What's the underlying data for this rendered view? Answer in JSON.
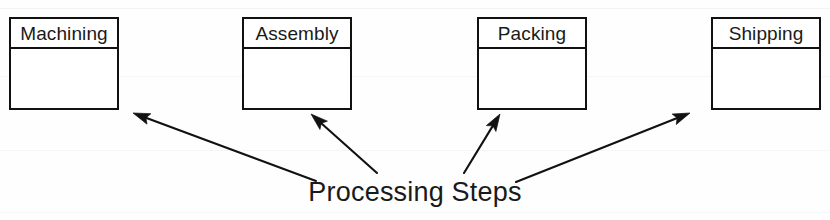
{
  "diagram": {
    "title": "Processing Steps",
    "caption": "Processing Steps",
    "background_color": "#fefefe",
    "line_color": "#111111",
    "text_color": "#1a1a1a",
    "boxes": [
      {
        "id": "machining",
        "label": "Machining",
        "x": 9,
        "y": 17,
        "width": 110,
        "height": 93
      },
      {
        "id": "assembly",
        "label": "Assembly",
        "x": 242,
        "y": 17,
        "width": 110,
        "height": 93
      },
      {
        "id": "packing",
        "label": "Packing",
        "x": 477,
        "y": 17,
        "width": 110,
        "height": 93
      },
      {
        "id": "shipping",
        "label": "Shipping",
        "x": 711,
        "y": 17,
        "width": 110,
        "height": 93
      }
    ],
    "arrows": [
      {
        "id": "arrow-to-machining",
        "target": "machining",
        "from_x": 316,
        "from_y": 181,
        "to_x": 133,
        "to_y": 113
      },
      {
        "id": "arrow-to-assembly",
        "target": "assembly",
        "from_x": 377,
        "from_y": 173,
        "to_x": 311,
        "to_y": 114
      },
      {
        "id": "arrow-to-packing",
        "target": "packing",
        "from_x": 464,
        "from_y": 173,
        "to_x": 500,
        "to_y": 114
      },
      {
        "id": "arrow-to-shipping",
        "target": "shipping",
        "from_x": 516,
        "from_y": 182,
        "to_x": 690,
        "to_y": 113
      }
    ]
  }
}
